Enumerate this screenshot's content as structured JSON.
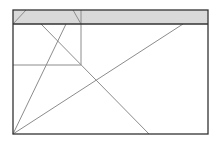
{
  "diagram": {
    "type": "wireframe",
    "width": 219,
    "height": 141,
    "colors": {
      "frame": "#333333",
      "header_fill": "#d9d9d9",
      "line": "#8c8c8c",
      "background": "#ffffff"
    },
    "frame": {
      "x": 13,
      "y": 10,
      "w": 195,
      "h": 124
    },
    "header": {
      "x": 13,
      "y": 10,
      "w": 195,
      "h": 14
    },
    "panel": {
      "x": 13,
      "y": 24,
      "w": 68,
      "h": 41
    },
    "lines": [
      {
        "x1": 13,
        "y1": 24,
        "x2": 26,
        "y2": 10
      },
      {
        "x1": 73,
        "y1": 10,
        "x2": 81,
        "y2": 24
      },
      {
        "x1": 41,
        "y1": 24,
        "x2": 149,
        "y2": 134
      },
      {
        "x1": 66,
        "y1": 24,
        "x2": 13,
        "y2": 134
      },
      {
        "x1": 183,
        "y1": 24,
        "x2": 13,
        "y2": 134
      }
    ]
  }
}
